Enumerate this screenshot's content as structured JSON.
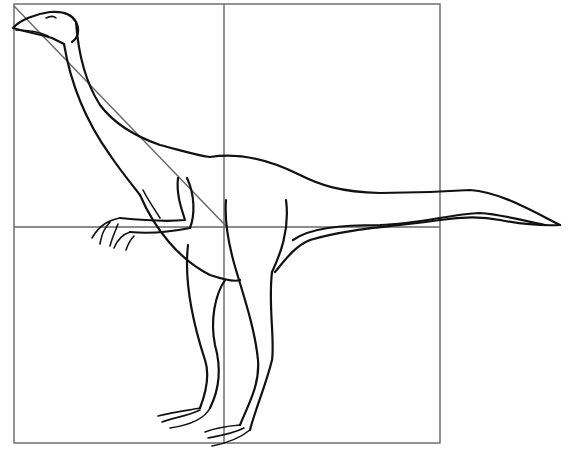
{
  "illustration": {
    "subject": "Ornithomimid dinosaur line drawing on construction grid",
    "colors": {
      "background": "#ffffff",
      "outline": "#111111",
      "grid": "#666666"
    }
  },
  "grid": {
    "left": 14,
    "top": 4,
    "right": 440,
    "bottom": 443,
    "mid_x": 224,
    "mid_y": 227
  }
}
